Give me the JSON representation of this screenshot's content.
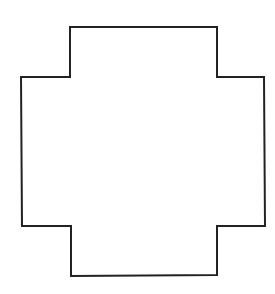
{
  "diagram": {
    "type": "polygon-outline",
    "shape_name": "stepped cross",
    "canvas": {
      "width": 275,
      "height": 294,
      "background": "#ffffff"
    },
    "stroke": {
      "color": "#222222",
      "width": 2
    },
    "fill": "none",
    "points": [
      [
        70,
        27
      ],
      [
        217,
        27
      ],
      [
        217,
        77
      ],
      [
        264,
        77
      ],
      [
        265,
        226
      ],
      [
        217,
        226
      ],
      [
        217,
        275
      ],
      [
        71,
        276
      ],
      [
        71,
        226
      ],
      [
        22,
        226
      ],
      [
        21,
        77
      ],
      [
        70,
        77
      ]
    ]
  }
}
